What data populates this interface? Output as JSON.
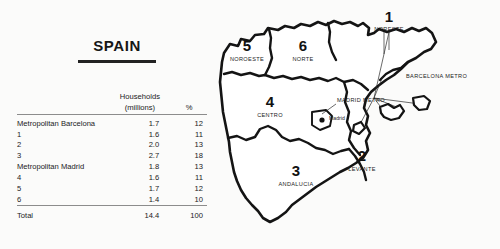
{
  "page_title": "SPAIN",
  "table": {
    "headers": {
      "label": "",
      "households_line1": "Households",
      "households_line2": "(millions)",
      "percent": "%"
    },
    "rows": [
      {
        "label": "Metropolitan Barcelona",
        "households": "1.7",
        "percent": "12"
      },
      {
        "label": "1",
        "households": "1.6",
        "percent": "11"
      },
      {
        "label": "2",
        "households": "2.0",
        "percent": "13"
      },
      {
        "label": "3",
        "households": "2.7",
        "percent": "18"
      },
      {
        "label": "Metropolitan Madrid",
        "households": "1.8",
        "percent": "13"
      },
      {
        "label": "4",
        "households": "1.6",
        "percent": "11"
      },
      {
        "label": "5",
        "households": "1.7",
        "percent": "12"
      },
      {
        "label": "6",
        "households": "1.4",
        "percent": "10"
      }
    ],
    "total": {
      "label": "Total",
      "households": "14.4",
      "percent": "100"
    }
  },
  "map": {
    "regions": [
      {
        "number": "1",
        "name": "NORESTE"
      },
      {
        "number": "2",
        "name": "LEVANTE"
      },
      {
        "number": "3",
        "name": "ANDALUCIA"
      },
      {
        "number": "4",
        "name": "CENTRO"
      },
      {
        "number": "5",
        "name": "NOROESTE"
      },
      {
        "number": "6",
        "name": "NORTE"
      }
    ],
    "annotations": {
      "barcelona_metro": "BARCELONA METRO",
      "madrid_metro": "MADRID METRO",
      "madrid_city": "Madrid"
    }
  },
  "colors": {
    "ink": "#141414",
    "rule": "#8c8c8c",
    "background": "#fbfbfa"
  }
}
